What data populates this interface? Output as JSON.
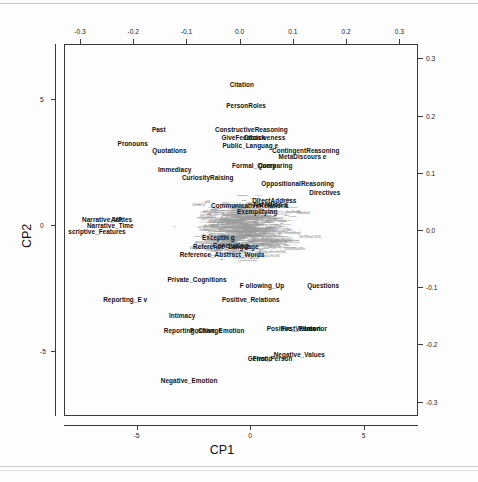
{
  "chart_data": {
    "type": "scatter",
    "title": "",
    "subtitle": "",
    "xlabel": "CP1",
    "ylabel": "CP2",
    "xlabel_top": "",
    "ylabel_right": "",
    "grid": false,
    "legend": null,
    "axes": {
      "bottom": {
        "label": "CP1",
        "ticks": [
          -5,
          0,
          5
        ],
        "tick_labels": [
          "-5",
          "0",
          "5"
        ],
        "lim": [
          -8.2,
          7.4
        ]
      },
      "left": {
        "label": "CP2",
        "ticks": [
          5,
          0,
          -5
        ],
        "tick_labels": [
          "5",
          "0",
          "-5"
        ],
        "lim": [
          -7.6,
          7.2
        ]
      },
      "top": {
        "label": "",
        "ticks": [
          -0.3,
          -0.2,
          -0.1,
          0.0,
          0.1,
          0.2,
          0.3
        ],
        "tick_labels": [
          "-0.3",
          "-0.2",
          "-0.1",
          "0.0",
          "0.1",
          "0.2",
          "0.3"
        ]
      },
      "right": {
        "label": "",
        "ticks": [
          0.3,
          0.2,
          0.1,
          0.0,
          -0.1,
          -0.2,
          -0.3
        ],
        "tick_labels": [
          "0.3",
          "0.2",
          "0.1",
          "0.0",
          "-0.1",
          "-0.2",
          "-0.3"
        ]
      }
    },
    "variable_points": [
      {
        "label": "Citation",
        "x": 0.004,
        "y": 0.255
      },
      {
        "label": "PersonRoles",
        "x": 0.012,
        "y": 0.218
      },
      {
        "label": "ConstructiveReasoning",
        "x": 0.022,
        "y": 0.176
      },
      {
        "label": "GiveFeedback",
        "x": 0.007,
        "y": 0.163
      },
      {
        "label": "Decisiveness",
        "x": 0.047,
        "y": 0.163
      },
      {
        "label": "Past",
        "x": -0.152,
        "y": 0.176
      },
      {
        "label": "Public_Languag e",
        "x": 0.02,
        "y": 0.148
      },
      {
        "label": "Pronouns",
        "x": -0.201,
        "y": 0.152
      },
      {
        "label": "Quotations",
        "x": -0.132,
        "y": 0.139
      },
      {
        "label": "ContingentReasoning",
        "x": 0.124,
        "y": 0.14
      },
      {
        "label": "MetaDiscours e",
        "x": 0.118,
        "y": 0.129
      },
      {
        "label": "Formal_Query",
        "x": 0.027,
        "y": 0.114
      },
      {
        "label": "Comparing",
        "x": 0.067,
        "y": 0.114
      },
      {
        "label": "Immediacy",
        "x": -0.122,
        "y": 0.107
      },
      {
        "label": "CuriosityRaising",
        "x": -0.06,
        "y": 0.093
      },
      {
        "label": "OppositionalReasoning",
        "x": 0.109,
        "y": 0.082
      },
      {
        "label": "Directives",
        "x": 0.16,
        "y": 0.066
      },
      {
        "label": "DirectAddress",
        "x": 0.065,
        "y": 0.052
      },
      {
        "label": "CommunicativeRelations",
        "x": 0.019,
        "y": 0.044
      },
      {
        "label": "Narration s",
        "x": 0.058,
        "y": 0.046
      },
      {
        "label": "Exemplifying",
        "x": 0.033,
        "y": 0.034
      },
      {
        "label": "Narrative_VP",
        "x": -0.258,
        "y": 0.02
      },
      {
        "label": "Asides",
        "x": -0.222,
        "y": 0.02
      },
      {
        "label": "Narrative_Time",
        "x": -0.243,
        "y": 0.009
      },
      {
        "label": "scriptive_Features",
        "x": -0.268,
        "y": -0.002
      },
      {
        "label": "Exceptin g",
        "x": -0.04,
        "y": -0.013
      },
      {
        "label": "Concluding",
        "x": -0.017,
        "y": -0.026
      },
      {
        "label": "Reference_Language",
        "x": -0.026,
        "y": -0.028
      },
      {
        "label": "Reference_Abstract_Words",
        "x": -0.033,
        "y": -0.042
      },
      {
        "label": "Private_Cognitions",
        "x": -0.08,
        "y": -0.086
      },
      {
        "label": "F ollowing_Up",
        "x": 0.042,
        "y": -0.096
      },
      {
        "label": "Questions",
        "x": 0.157,
        "y": -0.096
      },
      {
        "label": "Reporting_E v",
        "x": -0.215,
        "y": -0.12
      },
      {
        "label": "Positive_Relations",
        "x": 0.021,
        "y": -0.12
      },
      {
        "label": "Intimacy",
        "x": -0.108,
        "y": -0.148
      },
      {
        "label": "Reporting_Change",
        "x": -0.088,
        "y": -0.174
      },
      {
        "label": "Positive_Emotion",
        "x": -0.042,
        "y": -0.174
      },
      {
        "label": "Positive_Values",
        "x": 0.097,
        "y": -0.172
      },
      {
        "label": "First_Person",
        "x": 0.115,
        "y": -0.172
      },
      {
        "label": "Interior",
        "x": 0.143,
        "y": -0.172
      },
      {
        "label": "Negative_Values",
        "x": 0.112,
        "y": -0.216
      },
      {
        "label": "Generic",
        "x": 0.038,
        "y": -0.224
      },
      {
        "label": "First_Person",
        "x": 0.062,
        "y": -0.224
      },
      {
        "label": "Negative_Emotion",
        "x": -0.095,
        "y": -0.262
      }
    ]
  },
  "figure": {
    "x_axis_title": "CP1",
    "y_axis_title": "CP2"
  }
}
